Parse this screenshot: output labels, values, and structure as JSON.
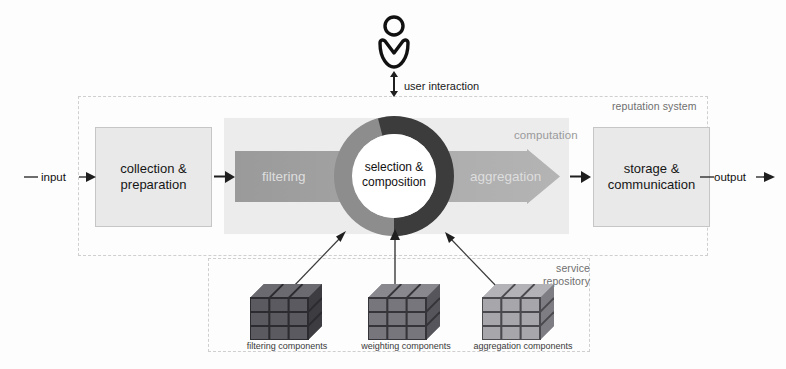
{
  "diagram": {
    "regions": {
      "reputation_system": "reputation system",
      "computation": "computation",
      "service_repository": "service\nrepository",
      "service_repository_line1": "service",
      "service_repository_line2": "repository"
    },
    "io": {
      "input": "input",
      "output": "output"
    },
    "actor": {
      "icon": "user-icon",
      "interaction_label": "user interaction"
    },
    "process_boxes": [
      {
        "id": "collection",
        "line1": "collection &",
        "line2": "preparation"
      },
      {
        "id": "storage",
        "line1": "storage &",
        "line2": "communication"
      }
    ],
    "flow_arrow": {
      "left_stage": "filtering",
      "right_stage": "aggregation"
    },
    "ring": {
      "center_line1": "selection &",
      "center_line2": "composition",
      "left_half_color": "#8d8d8d",
      "right_half_color": "#3c3c3c"
    },
    "repository_components": [
      {
        "id": "filtering",
        "label": "filtering components",
        "shade": "#55555a"
      },
      {
        "id": "weighting",
        "label": "weighting components",
        "shade": "#6e6e73"
      },
      {
        "id": "aggregation",
        "label": "aggregation components",
        "shade": "#9a9a9e"
      }
    ],
    "colors": {
      "box_fill": "#e9e9e9",
      "box_border": "#c6c6c6",
      "band_fill": "#ececed",
      "arrow_fill": "#9e9e9e",
      "dashed_border": "#cfcfcf",
      "text": "#161616",
      "muted_text": "#6f6f6f",
      "flow_text": "#dedede"
    }
  }
}
